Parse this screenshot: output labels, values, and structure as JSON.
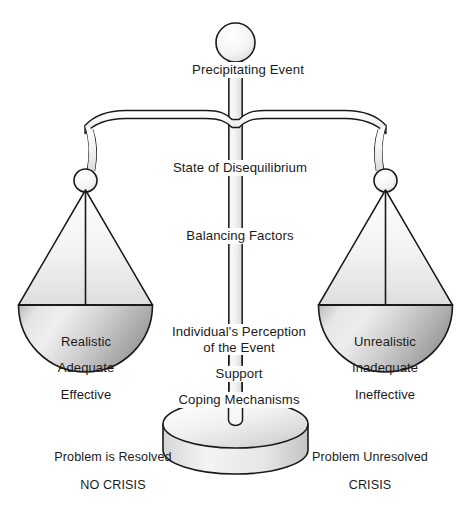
{
  "diagram": {
    "title_strip": "",
    "edge_marginalia": "",
    "top": {
      "ball": "precipitating-event-ball",
      "label": "Precipitating Event"
    },
    "column": {
      "state_label": "State of Disequilibrium",
      "balancing_label": "Balancing Factors",
      "perception_line1": "Individual's Perception",
      "perception_line2": "of the Event",
      "support_label": "Support",
      "coping_label": "Coping Mechanisms"
    },
    "left_pan": {
      "items": [
        "Realistic",
        "Adequate",
        "Effective"
      ],
      "outcome": "Problem is Resolved",
      "verdict": "NO CRISIS"
    },
    "right_pan": {
      "items": [
        "Unrealistic",
        "Inadequate",
        "Ineffective"
      ],
      "outcome": "Problem Unresolved",
      "verdict": "CRISIS"
    },
    "colors": {
      "stroke": "#1a1a1a",
      "pan_light": "#fbfbfb",
      "pan_mid": "#d9d9d9",
      "pan_dark": "#a8a8a8",
      "background": "#ffffff"
    }
  }
}
